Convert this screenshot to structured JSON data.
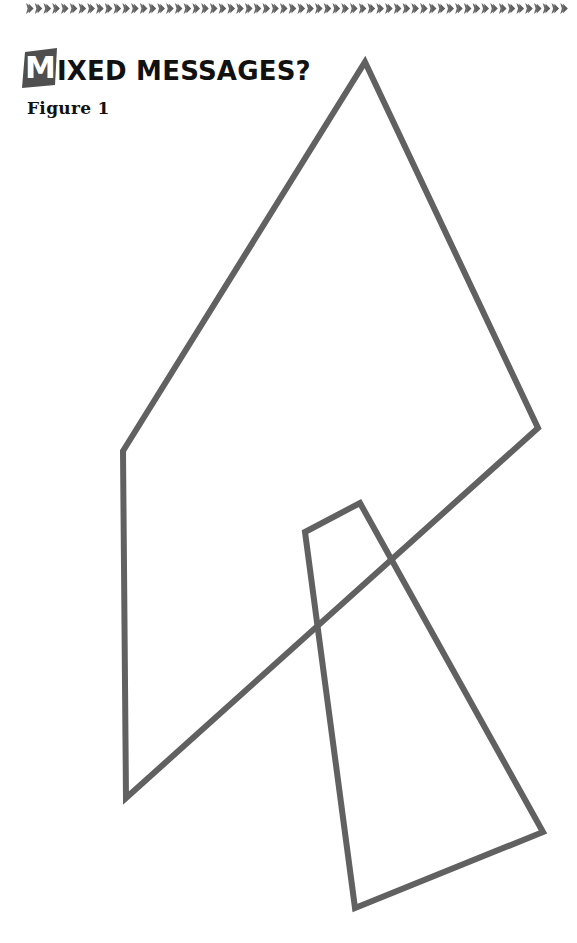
{
  "page": {
    "background_color": "#ffffff",
    "width": 577,
    "height": 943
  },
  "top_rule": {
    "icon": "chevron-repeat-ornament",
    "repeat_count": 62,
    "color": "#6b6b6b",
    "start_x": 26,
    "end_x": 569
  },
  "heading": {
    "dropcap": "M",
    "dropcap_box_color": "#4f4f4f",
    "dropcap_text_color": "#ffffff",
    "rest": "IXED MESSAGES?",
    "full_text": "Mixed Messages?",
    "color": "#111111"
  },
  "caption": {
    "text": "Figure 1",
    "color": "#111111"
  },
  "chart_data": {
    "type": "diagram",
    "title": "Figure 1",
    "stroke_color": "#616161",
    "stroke_width": 6,
    "fill": "none",
    "grid": false,
    "legend": null,
    "xlabel": "",
    "ylabel": "",
    "xlim": [
      0,
      577
    ],
    "ylim": [
      0,
      943
    ],
    "shapes": [
      {
        "name": "large-quadrilateral",
        "closed": true,
        "points": [
          [
            365,
            62
          ],
          [
            538,
            428
          ],
          [
            126,
            798
          ],
          [
            123,
            451
          ]
        ]
      },
      {
        "name": "small-quadrilateral",
        "closed": true,
        "points": [
          [
            360,
            503
          ],
          [
            543,
            832
          ],
          [
            355,
            908
          ],
          [
            305,
            532
          ]
        ]
      }
    ],
    "annotations": []
  }
}
